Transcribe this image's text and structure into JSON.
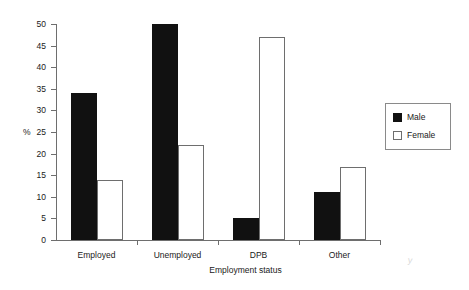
{
  "chart_data": {
    "type": "bar",
    "title": "",
    "subtitle": "",
    "xlabel": "Employment status",
    "ylabel": "%",
    "categories": [
      "Employed",
      "Unemployed",
      "DPB",
      "Other"
    ],
    "series": [
      {
        "name": "Male",
        "color": "#111111",
        "values": [
          34,
          50,
          5,
          11
        ]
      },
      {
        "name": "Female",
        "color": "#ffffff",
        "values": [
          14,
          22,
          47,
          17
        ]
      }
    ],
    "ylim": [
      0,
      50
    ],
    "ytick_step": 5,
    "ytick_labels": [
      "0",
      "5",
      "10",
      "15",
      "20",
      "25",
      "30",
      "35",
      "40",
      "45",
      "50"
    ],
    "grid": false,
    "legend_position": "upper-right",
    "legend_entries": [
      "Male",
      "Female"
    ]
  },
  "axes": {
    "y_title": "%",
    "x_title": "Employment status"
  },
  "legend": {
    "items": [
      {
        "label": "Male"
      },
      {
        "label": "Female"
      }
    ]
  },
  "artifact": {
    "mark": "y"
  }
}
